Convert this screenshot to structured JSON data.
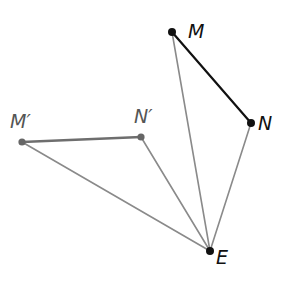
{
  "diagram": {
    "type": "geometric-rotation",
    "colors": {
      "original_segment": "#111111",
      "image_segment": "#6e6e6e",
      "rays": "#8a8a8a",
      "original_points": "#111111",
      "image_points": "#666666",
      "background": "#ffffff"
    },
    "points": [
      {
        "id": "M",
        "label": "M",
        "x": 172,
        "y": 32,
        "label_x": 188,
        "label_y": 38
      },
      {
        "id": "N",
        "label": "N",
        "x": 251,
        "y": 123,
        "label_x": 258,
        "label_y": 130
      },
      {
        "id": "Mp",
        "label": "M′",
        "x": 22,
        "y": 142,
        "label_x": 10,
        "label_y": 128
      },
      {
        "id": "Np",
        "label": "N′",
        "x": 141,
        "y": 137,
        "label_x": 134,
        "label_y": 123
      },
      {
        "id": "E",
        "label": "E",
        "x": 210,
        "y": 251,
        "label_x": 216,
        "label_y": 264
      }
    ],
    "segments": [
      {
        "from": "M",
        "to": "N",
        "role": "original"
      },
      {
        "from": "Mp",
        "to": "Np",
        "role": "image"
      },
      {
        "from": "M",
        "to": "E",
        "role": "ray"
      },
      {
        "from": "N",
        "to": "E",
        "role": "ray"
      },
      {
        "from": "Mp",
        "to": "E",
        "role": "ray"
      },
      {
        "from": "Np",
        "to": "E",
        "role": "ray"
      }
    ]
  }
}
